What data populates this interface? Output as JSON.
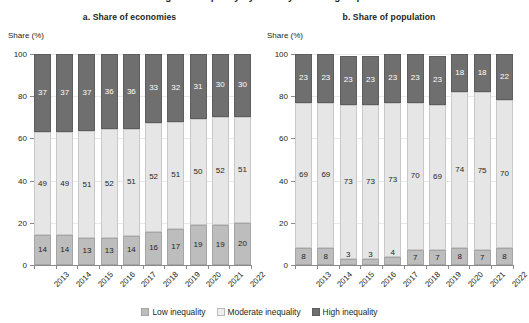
{
  "figure": {
    "supertitle": "Figure: Inequality by country income group",
    "yaxis_label": "Share (%)",
    "yticks": [
      "0",
      "20",
      "40",
      "60",
      "80",
      "100"
    ],
    "ylim": [
      0,
      100
    ]
  },
  "legend": {
    "items": [
      {
        "label": "Low inequality",
        "color": "#bdbdbd",
        "swatch": "low-swatch"
      },
      {
        "label": "Moderate inequality",
        "color": "#efefef",
        "swatch": "moderate-swatch"
      },
      {
        "label": "High inequality",
        "color": "#6f6f6f",
        "swatch": "high-swatch"
      }
    ]
  },
  "chart_data": [
    {
      "type": "bar",
      "id": "panel-a",
      "title": "a. Share of economies",
      "xlabel": "",
      "ylabel": "Share (%)",
      "ylim": [
        0,
        100
      ],
      "yticks": [
        0,
        20,
        40,
        60,
        80,
        100
      ],
      "grid": true,
      "stacked": true,
      "legend_position": "bottom",
      "categories": [
        "2013",
        "2014",
        "2015",
        "2016",
        "2017",
        "2018",
        "2019",
        "2020",
        "2021",
        "2022"
      ],
      "series": [
        {
          "name": "Low inequality",
          "color": "#bdbdbd",
          "values": [
            14,
            14,
            13,
            13,
            14,
            16,
            17,
            19,
            19,
            20
          ]
        },
        {
          "name": "Moderate inequality",
          "color": "#e6e6e6",
          "values": [
            49,
            49,
            51,
            52,
            51,
            52,
            51,
            50,
            52,
            51
          ]
        },
        {
          "name": "High inequality",
          "color": "#6f6f6f",
          "values": [
            37,
            37,
            37,
            36,
            36,
            33,
            32,
            31,
            30,
            30
          ]
        }
      ]
    },
    {
      "type": "bar",
      "id": "panel-b",
      "title": "b. Share of population",
      "xlabel": "",
      "ylabel": "Share (%)",
      "ylim": [
        0,
        100
      ],
      "yticks": [
        0,
        20,
        40,
        60,
        80,
        100
      ],
      "grid": true,
      "stacked": true,
      "legend_position": "bottom",
      "categories": [
        "2013",
        "2014",
        "2015",
        "2016",
        "2017",
        "2018",
        "2019",
        "2020",
        "2021",
        "2022"
      ],
      "series": [
        {
          "name": "Low inequality",
          "color": "#bdbdbd",
          "values": [
            8,
            8,
            3,
            3,
            4,
            7,
            7,
            8,
            7,
            8
          ]
        },
        {
          "name": "Moderate inequality",
          "color": "#e6e6e6",
          "values": [
            69,
            69,
            73,
            73,
            73,
            70,
            69,
            74,
            75,
            70
          ]
        },
        {
          "name": "High inequality",
          "color": "#6f6f6f",
          "values": [
            23,
            23,
            23,
            23,
            23,
            23,
            23,
            18,
            18,
            22
          ]
        }
      ]
    }
  ]
}
